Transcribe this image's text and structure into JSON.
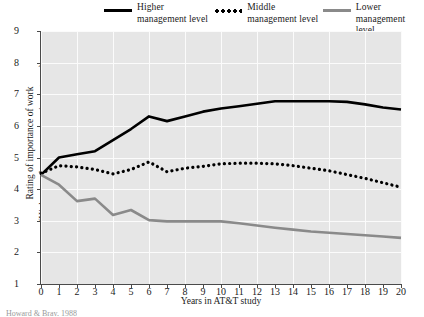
{
  "legend": {
    "items": [
      {
        "label_line1": "Higher",
        "label_line2": "management level",
        "style": "solid",
        "color": "#000000",
        "name": "higher"
      },
      {
        "label_line1": "Middle",
        "label_line2": "management level",
        "style": "dotted",
        "color": "#000000",
        "name": "middle"
      },
      {
        "label_line1": "Lower",
        "label_line2": "management level",
        "style": "solid",
        "color": "#8a8a8a",
        "name": "lower"
      }
    ]
  },
  "axes": {
    "ylabel_line1": "Rating of importance of work",
    "ylabel_line2": "(Higher numbers mean more importance)",
    "xlabel": "Years in AT&T study",
    "yticks": [
      "9",
      "8",
      "7",
      "6",
      "5",
      "4",
      "3",
      "2",
      "1"
    ],
    "xticks": [
      "0",
      "1",
      "2",
      "3",
      "4",
      "5",
      "6",
      "7",
      "8",
      "9",
      "10",
      "11",
      "12",
      "13",
      "14",
      "15",
      "16",
      "17",
      "18",
      "19",
      "20"
    ]
  },
  "source_note": "Howard & Bray, 1988",
  "chart_data": {
    "type": "line",
    "title": "",
    "xlabel": "Years in AT&T study",
    "ylabel": "Rating of importance of work (Higher numbers mean more importance)",
    "xlim": [
      0,
      20
    ],
    "ylim": [
      1,
      9
    ],
    "grid": true,
    "legend_position": "top",
    "x": [
      0,
      1,
      2,
      3,
      4,
      5,
      6,
      7,
      8,
      9,
      10,
      11,
      12,
      13,
      14,
      15,
      16,
      17,
      18,
      19,
      20
    ],
    "series": [
      {
        "name": "Higher management level",
        "color": "#000000",
        "style": "solid",
        "values": [
          4.45,
          5.0,
          5.1,
          5.2,
          5.55,
          5.9,
          6.3,
          6.15,
          6.3,
          6.45,
          6.55,
          6.62,
          6.7,
          6.78,
          6.78,
          6.78,
          6.78,
          6.76,
          6.68,
          6.58,
          6.52
        ]
      },
      {
        "name": "Middle management level",
        "color": "#000000",
        "style": "dotted",
        "values": [
          4.5,
          4.74,
          4.7,
          4.62,
          4.48,
          4.62,
          4.86,
          4.55,
          4.66,
          4.72,
          4.8,
          4.82,
          4.82,
          4.8,
          4.74,
          4.66,
          4.58,
          4.46,
          4.34,
          4.2,
          4.06
        ]
      },
      {
        "name": "Lower management level",
        "color": "#8a8a8a",
        "style": "solid",
        "values": [
          4.45,
          4.14,
          3.62,
          3.7,
          3.18,
          3.34,
          3.02,
          2.98,
          2.98,
          2.98,
          2.98,
          2.92,
          2.85,
          2.78,
          2.72,
          2.66,
          2.62,
          2.58,
          2.54,
          2.5,
          2.46
        ]
      }
    ]
  }
}
